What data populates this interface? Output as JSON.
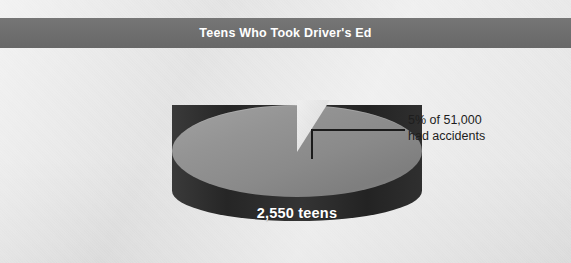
{
  "title": {
    "text": "Teens Who Took Driver's Ed",
    "bar_color": "#6d6d6d",
    "text_color": "#ffffff"
  },
  "background_color": "#e5e5e5",
  "callout": {
    "line1": "5% of 51,000",
    "line2": "had accidents",
    "leader_color": "#1b1b1b",
    "text_color": "#1d1d1d"
  },
  "pie": {
    "center_label": "2,550 teens",
    "top_color": "#8f8f8f",
    "side_color": "#2f2f2f",
    "label_color": "#ffffff"
  },
  "chart_data": {
    "type": "pie",
    "title": "Teens Who Took Driver's Ed",
    "subtitle": "",
    "xlabel": "",
    "ylabel": "",
    "legend_position": "none",
    "grid": false,
    "three_d": true,
    "total": 51000,
    "total_label": "51,000",
    "categories": [
      "Teens who took driver's ed (no accidents)",
      "Had accidents"
    ],
    "values": [
      48450,
      2550
    ],
    "percentages": [
      95,
      5
    ],
    "data_labels": [
      "2,550 teens",
      "5% of 51,000 had accidents"
    ],
    "colors": [
      "#8f8f8f",
      "#e5e5e5"
    ],
    "annotations": [
      {
        "text": "5% of 51,000 had accidents",
        "points_to": "exploded 5% wedge at top of pie"
      },
      {
        "text": "2,550 teens",
        "points_to": "pie face"
      }
    ]
  }
}
